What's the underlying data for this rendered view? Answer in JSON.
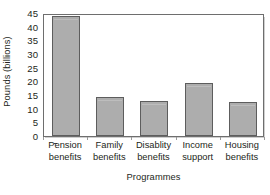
{
  "chart_data": {
    "type": "bar",
    "title": "",
    "xlabel": "Programmes",
    "ylabel": "Pounds (billions)",
    "categories": [
      "Pension benefits",
      "Family benefits",
      "Disablity benefits",
      "Income support",
      "Housing benefits"
    ],
    "category_lines": [
      [
        "Pension",
        "benefits"
      ],
      [
        "Family",
        "benefits"
      ],
      [
        "Disablity",
        "benefits"
      ],
      [
        "Income",
        "support"
      ],
      [
        "Housing",
        "benefits"
      ]
    ],
    "values": [
      44,
      14.3,
      12.8,
      19.5,
      12.5
    ],
    "ylim": [
      0,
      45
    ],
    "ytick_values": [
      0,
      5,
      10,
      15,
      20,
      25,
      30,
      35,
      40,
      45
    ],
    "ytick_labels": [
      "0",
      "5",
      "10",
      "15",
      "20",
      "25",
      "30",
      "35",
      "40",
      "45"
    ],
    "grid": false,
    "legend": "none",
    "bar_color": "#adadad",
    "bar_edge_color": "#5d5d5d",
    "axis_color": "#6e6e6e",
    "text_color": "#231f20",
    "background": "#ffffff"
  }
}
